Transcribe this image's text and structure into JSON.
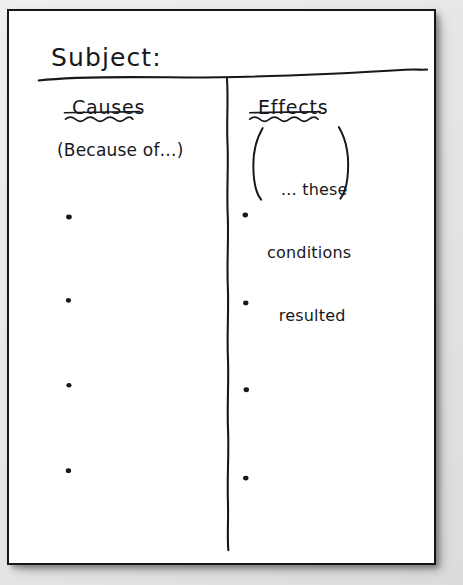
{
  "worksheet": {
    "title_label": "Subject:",
    "columns": [
      {
        "id": "causes",
        "heading": "Causes",
        "hint": "(Because of…)",
        "bullet_count": 4
      },
      {
        "id": "effects",
        "heading": "Effects",
        "hint_line_1": "… these",
        "hint_line_2": "conditions",
        "hint_line_3": "resulted",
        "bullet_count": 4
      }
    ],
    "colors": {
      "ink": "#17181c",
      "paper": "#ffffff",
      "backdrop": "#e8e8e8"
    }
  }
}
